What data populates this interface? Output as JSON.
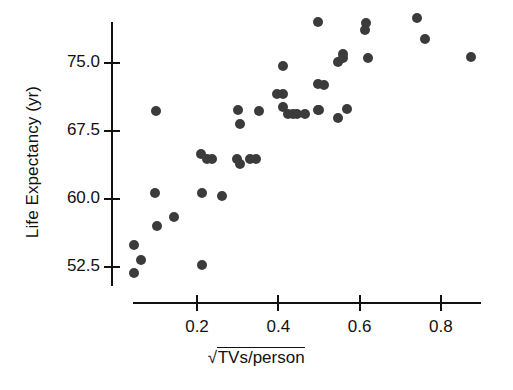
{
  "chart_data": {
    "type": "scatter",
    "title": "",
    "xlabel": "√TVs/person",
    "ylabel": "Life Expectancy (yr)",
    "xlabel_parts": {
      "radical": "√",
      "radicand": "TVs/person"
    },
    "xlim": [
      0.0,
      0.9
    ],
    "ylim": [
      50.0,
      81.0
    ],
    "xticks": [
      0.2,
      0.4,
      0.6,
      0.8
    ],
    "xticklabels": [
      "0.2",
      "0.4",
      "0.6",
      "0.8"
    ],
    "yticks": [
      52.5,
      60.0,
      67.5,
      75.0
    ],
    "yticklabels": [
      "52.5",
      "60.0",
      "67.5",
      "75.0"
    ],
    "grid": false,
    "legend": null,
    "marker": {
      "shape": "circle",
      "color": "#3b3b3b",
      "size_px": 10
    },
    "n_points": 44,
    "points": [
      {
        "x": 0.045,
        "y": 51.8
      },
      {
        "x": 0.044,
        "y": 54.9
      },
      {
        "x": 0.063,
        "y": 53.3
      },
      {
        "x": 0.101,
        "y": 57.0
      },
      {
        "x": 0.096,
        "y": 60.7
      },
      {
        "x": 0.1,
        "y": 69.7
      },
      {
        "x": 0.143,
        "y": 58.0
      },
      {
        "x": 0.21,
        "y": 65.0
      },
      {
        "x": 0.213,
        "y": 60.7
      },
      {
        "x": 0.212,
        "y": 52.7
      },
      {
        "x": 0.225,
        "y": 64.4
      },
      {
        "x": 0.238,
        "y": 64.4
      },
      {
        "x": 0.261,
        "y": 60.3
      },
      {
        "x": 0.298,
        "y": 64.4
      },
      {
        "x": 0.305,
        "y": 63.9
      },
      {
        "x": 0.305,
        "y": 68.3
      },
      {
        "x": 0.33,
        "y": 64.4
      },
      {
        "x": 0.353,
        "y": 69.7
      },
      {
        "x": 0.398,
        "y": 71.6
      },
      {
        "x": 0.412,
        "y": 71.6
      },
      {
        "x": 0.412,
        "y": 74.7
      },
      {
        "x": 0.412,
        "y": 70.2
      },
      {
        "x": 0.423,
        "y": 69.4
      },
      {
        "x": 0.437,
        "y": 69.4
      },
      {
        "x": 0.446,
        "y": 69.4
      },
      {
        "x": 0.497,
        "y": 72.7
      },
      {
        "x": 0.497,
        "y": 79.5
      },
      {
        "x": 0.498,
        "y": 69.8
      },
      {
        "x": 0.5,
        "y": 69.8
      },
      {
        "x": 0.546,
        "y": 75.1
      },
      {
        "x": 0.548,
        "y": 68.9
      },
      {
        "x": 0.56,
        "y": 76.0
      },
      {
        "x": 0.56,
        "y": 75.5
      },
      {
        "x": 0.57,
        "y": 69.9
      },
      {
        "x": 0.615,
        "y": 79.4
      },
      {
        "x": 0.613,
        "y": 78.6
      },
      {
        "x": 0.62,
        "y": 75.5
      },
      {
        "x": 0.742,
        "y": 80.0
      },
      {
        "x": 0.762,
        "y": 77.6
      },
      {
        "x": 0.873,
        "y": 75.7
      },
      {
        "x": 0.302,
        "y": 69.8
      },
      {
        "x": 0.346,
        "y": 64.4
      },
      {
        "x": 0.466,
        "y": 69.4
      },
      {
        "x": 0.512,
        "y": 72.6
      }
    ]
  }
}
